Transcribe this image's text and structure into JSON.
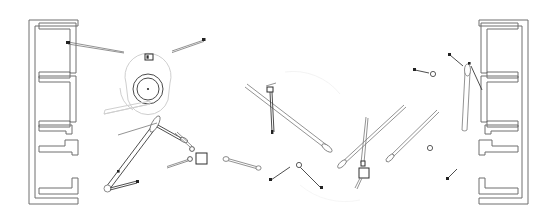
{
  "document": {
    "title": "Technical Line Drawing",
    "background_color": "#ffffff",
    "canvas": {
      "width": 557,
      "height": 222
    },
    "stroke_color": "#6e6e6e",
    "accent_color": "#2f2f2f"
  },
  "layers": {
    "left_wall_label": "left-wall-assembly",
    "right_wall_label": "right-wall-assembly",
    "center_fixture_label": "circular-fixture",
    "annotations_label": "leader-rods"
  },
  "elements": {
    "left_wall": "left wall plan with four stacked chambers",
    "right_wall": "right wall plan with four stacked chambers",
    "circular_fixture": "concentric circular fixture with center point",
    "badge_marker": "small rectangular badge marker above fixture",
    "square_node": "small square node connector",
    "hanging_node": "suspended square node on thin stem",
    "vertical_tube": "tall narrow vertical tube",
    "long_diagonal_a": "long diagonal rod upper-center",
    "long_diagonal_b": "long diagonal rod right-center",
    "pointer_left": "pointer rod aimed at left wall",
    "pointer_upper": "pointer rod upper center"
  },
  "counts": {
    "walls": 2,
    "chambers_per_wall": 4,
    "rods": 16,
    "nodes": 6
  }
}
